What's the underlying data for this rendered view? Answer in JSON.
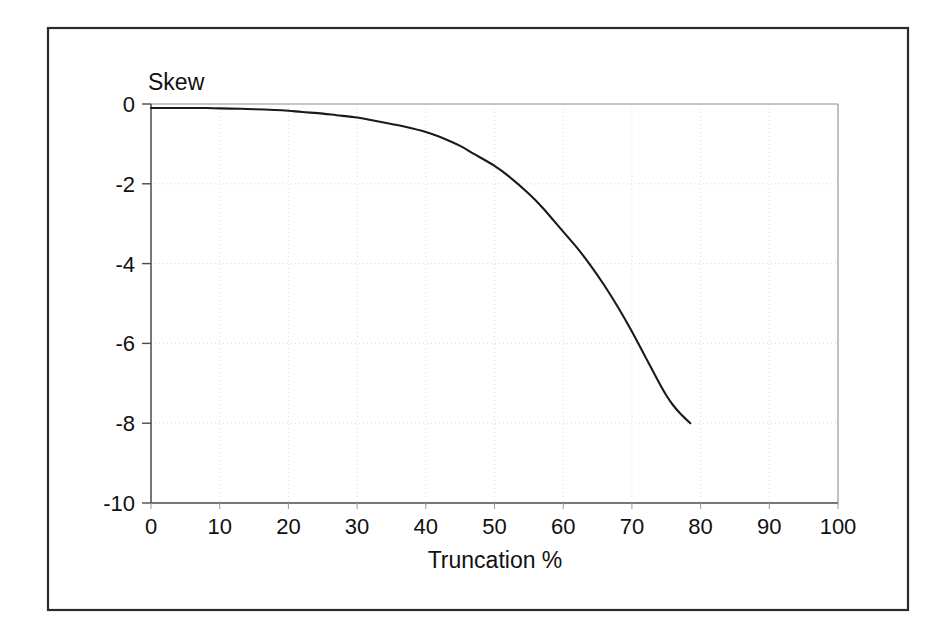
{
  "figure": {
    "background_color": "#ffffff",
    "frame_color": "#2b2b2b",
    "curve_color": "#1a1a1a",
    "grid_color": "#d8d8d8",
    "axis_color": "#4a4a4a"
  },
  "chart_data": {
    "type": "line",
    "title": "",
    "subtitle": "",
    "xlabel": "Truncation %",
    "ylabel": "Skew",
    "ylabel_placement": "top-left-above-axis",
    "xlim": [
      0,
      100
    ],
    "ylim": [
      -10,
      0
    ],
    "grid": true,
    "grid_style": "faint dotted",
    "legend": "none",
    "legend_position": "none",
    "xticks": [
      0,
      10,
      20,
      30,
      40,
      50,
      60,
      70,
      80,
      90,
      100
    ],
    "xtick_labels": [
      "0",
      "10",
      "20",
      "30",
      "40",
      "50",
      "60",
      "70",
      "80",
      "90",
      "100"
    ],
    "yticks": [
      0,
      -2,
      -4,
      -6,
      -8,
      -10
    ],
    "ytick_labels": [
      "0",
      "-2",
      "-4",
      "-6",
      "-8",
      "-10"
    ],
    "series": [
      {
        "name": "Skew vs Truncation",
        "x": [
          0,
          2,
          5,
          8,
          10,
          13,
          15,
          18,
          20,
          22,
          25,
          27,
          30,
          32,
          35,
          37,
          40,
          42,
          45,
          47,
          50,
          52,
          55,
          57,
          60,
          62,
          64,
          66,
          68,
          70,
          72,
          74,
          75,
          76,
          77,
          78,
          78.5
        ],
        "values": [
          -0.1,
          -0.1,
          -0.1,
          -0.1,
          -0.11,
          -0.12,
          -0.13,
          -0.15,
          -0.17,
          -0.2,
          -0.24,
          -0.28,
          -0.34,
          -0.4,
          -0.5,
          -0.57,
          -0.7,
          -0.82,
          -1.05,
          -1.25,
          -1.55,
          -1.8,
          -2.25,
          -2.6,
          -3.2,
          -3.6,
          -4.05,
          -4.55,
          -5.1,
          -5.7,
          -6.35,
          -7.0,
          -7.3,
          -7.55,
          -7.75,
          -7.92,
          -8.0
        ]
      }
    ],
    "annotations": []
  }
}
